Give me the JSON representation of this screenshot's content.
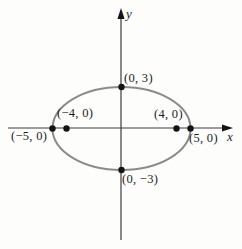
{
  "figure": {
    "axes": {
      "x_label": "x",
      "y_label": "y"
    },
    "ellipse": {
      "center": [
        0,
        0
      ],
      "semi_axis_x": 5,
      "semi_axis_y": 3
    },
    "points": [
      {
        "id": "co-vertex-top",
        "coords": [
          0,
          3
        ],
        "label": "(0, 3)"
      },
      {
        "id": "focus-left",
        "coords": [
          -4,
          0
        ],
        "label": "(−4, 0)"
      },
      {
        "id": "focus-right",
        "coords": [
          4,
          0
        ],
        "label": "(4, 0)"
      },
      {
        "id": "vertex-left",
        "coords": [
          -5,
          0
        ],
        "label": "(−5, 0)"
      },
      {
        "id": "vertex-right",
        "coords": [
          5,
          0
        ],
        "label": "(5, 0)"
      },
      {
        "id": "co-vertex-bottom",
        "coords": [
          0,
          -3
        ],
        "label": "(0, −3)"
      }
    ],
    "colors": {
      "curve": "#8b8b8b",
      "axis": "#3d3d3d",
      "dot": "#141414",
      "text": "#1c1c1c",
      "background": "#fdfdfc"
    }
  }
}
